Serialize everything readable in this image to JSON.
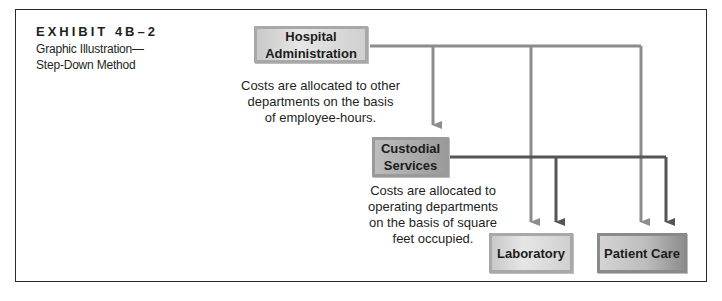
{
  "exhibit": {
    "label": "EXHIBIT 4B–2",
    "title": "Graphic Illustration—Step-Down Method"
  },
  "nodes": {
    "hospital_admin": {
      "line1": "Hospital",
      "line2": "Administration"
    },
    "custodial": {
      "line1": "Custodial",
      "line2": "Services"
    },
    "laboratory": {
      "label": "Laboratory"
    },
    "patient_care": {
      "label": "Patient Care"
    }
  },
  "notes": {
    "admin_basis": [
      "Costs are allocated to other",
      "departments on the basis",
      "of employee-hours."
    ],
    "custodial_basis": [
      "Costs are allocated to",
      "operating departments",
      "on the basis of square",
      "feet occupied."
    ]
  },
  "colors": {
    "admin_arrow": "#8c8c8c",
    "custodial_arrow": "#555555",
    "frame": "#2a2a2a"
  }
}
